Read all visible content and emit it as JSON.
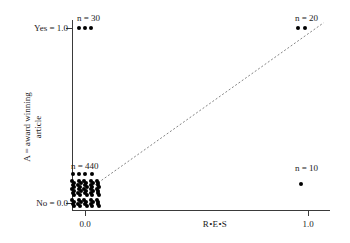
{
  "chart_data": {
    "type": "scatter",
    "title": "",
    "xlabel": "R•E•S",
    "ylabel_lines": [
      "A = award winning",
      "article"
    ],
    "ylabel": "A = award winning article",
    "xlim": [
      -0.06,
      1.18
    ],
    "ylim": [
      -0.06,
      1.1
    ],
    "xticks": [
      0.0,
      1.0
    ],
    "xticklabels": [
      "0.0",
      "1.0"
    ],
    "yticks": [
      0.0,
      1.0
    ],
    "yticklabels": [
      "No = 0.0",
      "Yes = 1.0"
    ],
    "grid": false,
    "legend": "none",
    "groups": [
      {
        "name": "yes-low-res",
        "annotation": "n = 30",
        "count": 30,
        "x": 0.02,
        "y": 1.0,
        "marker_count": 3
      },
      {
        "name": "yes-high-res",
        "annotation": "n = 20",
        "count": 20,
        "x": 1.0,
        "y": 1.0,
        "marker_count": 2
      },
      {
        "name": "no-low-res",
        "annotation": "n = 440",
        "count": 440,
        "x": 0.0,
        "y": 0.0,
        "marker_count": 44
      },
      {
        "name": "no-high-res",
        "annotation": "n = 10",
        "count": 10,
        "x": 1.0,
        "y": 0.1,
        "marker_count": 1
      }
    ],
    "reference_line": {
      "style": "dashed",
      "color": "#777777",
      "from": [
        0.03,
        0.09
      ],
      "to": [
        1.07,
        1.03
      ]
    },
    "colors": {
      "marker": "#000000",
      "axis": "#3a3a3a",
      "reference_line": "#777777",
      "text": "#1a1a1a",
      "background": "#ffffff"
    }
  },
  "axis": {
    "y_label_yes": "Yes = 1.0",
    "y_label_no": "No = 0.0",
    "x_label_0": "0.0",
    "x_label_1": "1.0",
    "x_title": "R•E•S",
    "y_title_line1": "A = award winning",
    "y_title_line2": "article"
  },
  "annotations": {
    "n30": "n = 30",
    "n20": "n = 20",
    "n440": "n = 440",
    "n10": "n = 10"
  }
}
